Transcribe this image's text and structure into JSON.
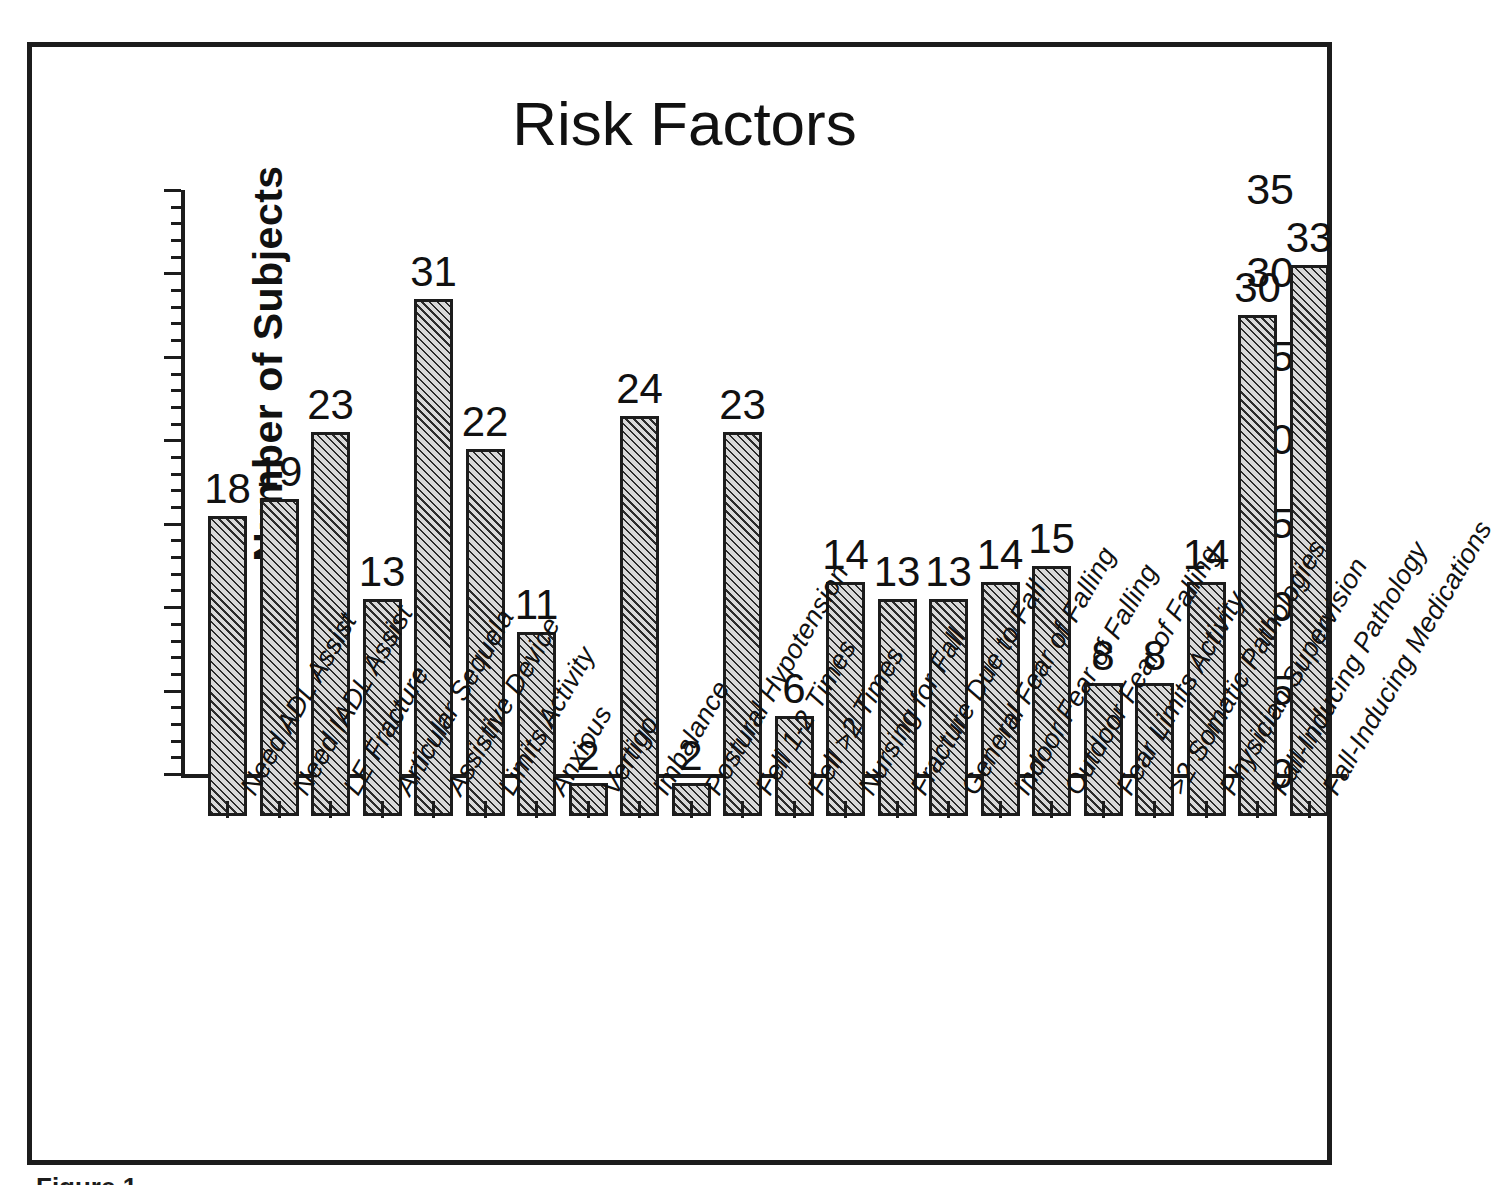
{
  "figure": {
    "caption": "Figure 1"
  },
  "chart_data": {
    "type": "bar",
    "title": "Risk Factors",
    "xlabel": "",
    "ylabel": "Number of Subjects",
    "ylim": [
      0,
      35
    ],
    "ytick_step": 5,
    "yticks": [
      0,
      5,
      10,
      15,
      20,
      25,
      30,
      35
    ],
    "ytick_labels": [
      "0",
      "5",
      "10",
      "15",
      "20",
      "25",
      "30",
      "35"
    ],
    "minor_tick_step": 1,
    "grid": false,
    "legend": null,
    "bar_fill": "diagonal-hatch",
    "bar_color": "#d9d9d9",
    "bar_edge_color": "#1c1c1c",
    "value_labels_shown": true,
    "categories": [
      "Need ADL Assist",
      "Need IADL Assist",
      "LE Fracture",
      "Articular Sequela",
      "Assistive Device",
      "Limits Activity",
      "Anxious",
      "Vertigo",
      "Imbalance",
      "Postural Hypotension",
      "Fell 1-2 Times",
      "Fell >2 Times",
      "Nursing for Fall",
      "Fracture Due to Fall",
      "General Fear of Falling",
      "Indoor Fear of Falling",
      "Outdoor Fear of Falling",
      "Fear Limits Activity",
      ">2 Somatic Pathologies",
      "Physician Supervision",
      "Fall-Inducing Pathology",
      "Fall-Inducing Medications"
    ],
    "values": [
      18,
      19,
      23,
      13,
      31,
      22,
      11,
      2,
      24,
      2,
      23,
      6,
      14,
      13,
      13,
      14,
      15,
      8,
      8,
      14,
      30,
      33
    ]
  }
}
